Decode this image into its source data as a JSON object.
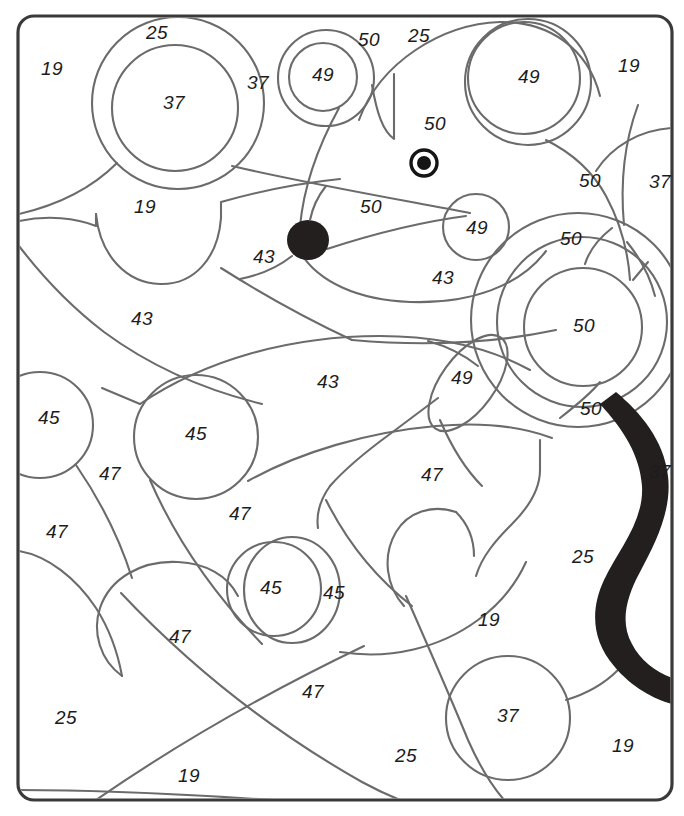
{
  "page": {
    "width": 684,
    "height": 816,
    "background_color": "#ffffff",
    "line_color": "#6b6b6b",
    "frame_color": "#3a3a3a",
    "number_color": "#1c1c1c",
    "fill_black_color": "#231f1e"
  },
  "frame": {
    "x": 18,
    "y": 16,
    "width": 654,
    "height": 784,
    "corner_radius": 16
  },
  "number_labels": [
    {
      "value": "19",
      "x": 52,
      "y": 70
    },
    {
      "value": "25",
      "x": 157,
      "y": 34
    },
    {
      "value": "37",
      "x": 174,
      "y": 104
    },
    {
      "value": "37",
      "x": 258,
      "y": 84
    },
    {
      "value": "49",
      "x": 323,
      "y": 76
    },
    {
      "value": "50",
      "x": 369,
      "y": 41
    },
    {
      "value": "25",
      "x": 419,
      "y": 37
    },
    {
      "value": "49",
      "x": 529,
      "y": 78
    },
    {
      "value": "19",
      "x": 629,
      "y": 67
    },
    {
      "value": "50",
      "x": 435,
      "y": 125
    },
    {
      "value": "19",
      "x": 145,
      "y": 208
    },
    {
      "value": "50",
      "x": 371,
      "y": 208
    },
    {
      "value": "50",
      "x": 590,
      "y": 182
    },
    {
      "value": "37",
      "x": 660,
      "y": 183
    },
    {
      "value": "49",
      "x": 477,
      "y": 229
    },
    {
      "value": "50",
      "x": 571,
      "y": 240
    },
    {
      "value": "43",
      "x": 264,
      "y": 258
    },
    {
      "value": "43",
      "x": 443,
      "y": 279
    },
    {
      "value": "43",
      "x": 142,
      "y": 320
    },
    {
      "value": "50",
      "x": 584,
      "y": 327
    },
    {
      "value": "43",
      "x": 328,
      "y": 383
    },
    {
      "value": "49",
      "x": 462,
      "y": 379
    },
    {
      "value": "50",
      "x": 591,
      "y": 410
    },
    {
      "value": "45",
      "x": 49,
      "y": 419
    },
    {
      "value": "45",
      "x": 196,
      "y": 435
    },
    {
      "value": "47",
      "x": 110,
      "y": 475
    },
    {
      "value": "47",
      "x": 432,
      "y": 476
    },
    {
      "value": "37",
      "x": 660,
      "y": 473
    },
    {
      "value": "47",
      "x": 57,
      "y": 533
    },
    {
      "value": "47",
      "x": 240,
      "y": 515
    },
    {
      "value": "45",
      "x": 271,
      "y": 589
    },
    {
      "value": "45",
      "x": 334,
      "y": 594
    },
    {
      "value": "25",
      "x": 583,
      "y": 558
    },
    {
      "value": "19",
      "x": 489,
      "y": 621
    },
    {
      "value": "47",
      "x": 180,
      "y": 638
    },
    {
      "value": "47",
      "x": 313,
      "y": 693
    },
    {
      "value": "37",
      "x": 508,
      "y": 717
    },
    {
      "value": "25",
      "x": 66,
      "y": 719
    },
    {
      "value": "25",
      "x": 406,
      "y": 757
    },
    {
      "value": "19",
      "x": 189,
      "y": 777
    },
    {
      "value": "19",
      "x": 623,
      "y": 747
    }
  ],
  "shapes": {
    "eye": {
      "cx": 424,
      "cy": 163,
      "outer_r": 13,
      "pupil_r": 7
    },
    "nose": {
      "cx": 308,
      "cy": 240,
      "rx": 21,
      "ry": 20
    }
  }
}
